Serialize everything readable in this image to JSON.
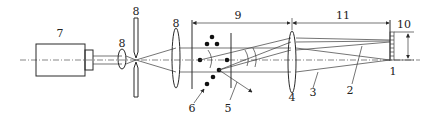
{
  "diagram": {
    "labels": {
      "camera": "7",
      "small_lens": "8",
      "aperture": "8",
      "collimator": "8",
      "region": "9",
      "particles": "6",
      "scattered_ray": "5",
      "receiving_lens": "4",
      "unscattered_ray": "3",
      "scattered_beam": "2",
      "detector": "1",
      "detector_height": "10",
      "focal_length": "11"
    },
    "colors": {
      "line": "#2a2a2a",
      "background": "#ffffff"
    }
  }
}
